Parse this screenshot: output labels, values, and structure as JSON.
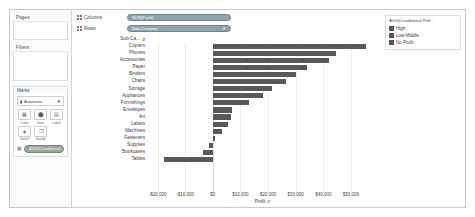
{
  "shelves": {
    "pages_label": "Pages",
    "filters_label": "Filters",
    "columns_label": "Columns",
    "rows_label": "Rows",
    "columns_pill": "SUM(Profit)",
    "rows_pill": "Sub-Category",
    "rows_pill_caret": "▼"
  },
  "marks": {
    "title": "Marks",
    "type_selected": "Automatic",
    "type_caret": "▼",
    "type_icon": "▮",
    "buttons": [
      {
        "caption": "Color",
        "icon": "▦"
      },
      {
        "caption": "Size",
        "icon": "⬤"
      },
      {
        "caption": "Label",
        "icon": "▤"
      },
      {
        "caption": "Detail",
        "icon": "▲"
      },
      {
        "caption": "Tooltip",
        "icon": "❐"
      }
    ],
    "mark_pill": "AGG(Conditional..."
  },
  "row_header": {
    "title": "Sub-Ca...",
    "sort_icon": "⇵",
    "labels": [
      "Copiers",
      "Phones",
      "Accessories",
      "Paper",
      "Binders",
      "Chairs",
      "Storage",
      "Appliances",
      "Furnishings",
      "Envelopes",
      "Art",
      "Labels",
      "Machines",
      "Fasteners",
      "Supplies",
      "Bookcases",
      "Tables"
    ]
  },
  "legend": {
    "title": "AGG(Conditional Prof...",
    "items": [
      {
        "label": "High",
        "color": "#585858"
      },
      {
        "label": "Low-Middle",
        "color": "#585858"
      },
      {
        "label": "No Profit",
        "color": "#585858"
      }
    ]
  },
  "colors": {
    "bar": "#585858",
    "gridline": "#ededed",
    "zeroline": "#d8d8d8"
  },
  "chart_data": {
    "type": "bar",
    "orientation": "horizontal",
    "title": "",
    "xlabel": "Profit",
    "ylabel": "Sub-Category",
    "xlim": [
      -22000,
      58000
    ],
    "grid": true,
    "legend_position": "right",
    "tick_labels": [
      "-$20,000",
      "-$10,000",
      "$0",
      "$10,000",
      "$20,000",
      "$30,000",
      "$40,000",
      "$50,000"
    ],
    "tick_values": [
      -20000,
      -10000,
      0,
      10000,
      20000,
      30000,
      40000,
      50000
    ],
    "axis_sort_icon": "⇵",
    "categories": [
      "Copiers",
      "Phones",
      "Accessories",
      "Paper",
      "Binders",
      "Chairs",
      "Storage",
      "Appliances",
      "Furnishings",
      "Envelopes",
      "Art",
      "Labels",
      "Machines",
      "Fasteners",
      "Supplies",
      "Bookcases",
      "Tables"
    ],
    "values": [
      55618,
      44516,
      41937,
      34054,
      30222,
      26590,
      21279,
      18138,
      13060,
      6964,
      6528,
      5546,
      3385,
      950,
      -1189,
      -3473,
      -17725
    ]
  }
}
